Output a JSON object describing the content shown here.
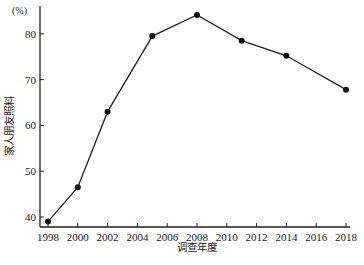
{
  "chart_data": {
    "type": "line",
    "title": "",
    "xlabel": "调查年度",
    "ylabel": "家人朋友照料",
    "y_unit": "(%)",
    "x": [
      1998,
      2000,
      2002,
      2005,
      2008,
      2011,
      2014,
      2018
    ],
    "series": [
      {
        "name": "家人朋友照料",
        "values": [
          39.0,
          46.5,
          63.0,
          79.5,
          84.1,
          78.5,
          75.2,
          67.8
        ]
      }
    ],
    "x_ticks": [
      "1998",
      "2000",
      "2002",
      "2004",
      "2006",
      "2008",
      "2010",
      "2012",
      "2014",
      "2016",
      "2018"
    ],
    "y_ticks": [
      "40",
      "50",
      "60",
      "70",
      "80"
    ],
    "xlim": [
      1998,
      2018
    ],
    "ylim": [
      38,
      85
    ],
    "grid": false,
    "legend": "none",
    "marker": "filled-circle",
    "line_color": "#222222"
  }
}
